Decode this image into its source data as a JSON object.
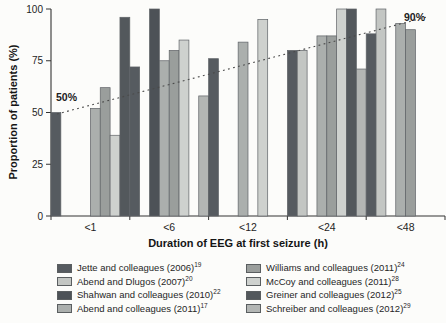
{
  "figure": {
    "background": "#fcfcfa",
    "axis_color": "#333333"
  },
  "chart_data": {
    "type": "bar",
    "title": "",
    "xlabel": "Duration of EEG at first seizure (h)",
    "ylabel": "Proportion of patients (%)",
    "ylim": [
      0,
      100
    ],
    "yticks": [
      0,
      25,
      50,
      75,
      100
    ],
    "categories": [
      "<1",
      "<6",
      "<12",
      "<24",
      "<48"
    ],
    "grid": false,
    "legend_position": "bottom",
    "slots_per_category": 8,
    "studies": [
      {
        "name": "Jette and colleagues (2006)",
        "ref": "19",
        "color": "#565b60"
      },
      {
        "name": "Abend and Dlugos (2007)",
        "ref": "20",
        "color": "#c3c6c3"
      },
      {
        "name": "Shahwan and colleagues (2010)",
        "ref": "22",
        "color": "#4d5257"
      },
      {
        "name": "Abend and colleagues (2011)",
        "ref": "17",
        "color": "#abafad"
      },
      {
        "name": "Williams and colleagues (2011)",
        "ref": "24",
        "color": "#9a9e9c"
      },
      {
        "name": "McCoy and colleagues (2011)",
        "ref": "28",
        "color": "#ced1ce"
      },
      {
        "name": "Greiner and colleagues (2012)",
        "ref": "25",
        "color": "#53585c"
      },
      {
        "name": "Schreiber and colleagues (2012)",
        "ref": "29",
        "color": "#b3b6b4"
      }
    ],
    "bars": [
      {
        "category": "<1",
        "study_index": 0,
        "slot": 0,
        "value": 50
      },
      {
        "category": "<1",
        "study_index": 3,
        "slot": 4,
        "value": 52
      },
      {
        "category": "<1",
        "study_index": 4,
        "slot": 5,
        "value": 62
      },
      {
        "category": "<1",
        "study_index": 5,
        "slot": 6,
        "value": 39
      },
      {
        "category": "<1",
        "study_index": 6,
        "slot": 7,
        "value": 96
      },
      {
        "category": "<6",
        "study_index": 0,
        "slot": 0,
        "value": 72
      },
      {
        "category": "<6",
        "study_index": 2,
        "slot": 2,
        "value": 100
      },
      {
        "category": "<6",
        "study_index": 3,
        "slot": 3,
        "value": 75
      },
      {
        "category": "<6",
        "study_index": 4,
        "slot": 4,
        "value": 80
      },
      {
        "category": "<6",
        "study_index": 5,
        "slot": 5,
        "value": 85
      },
      {
        "category": "<6",
        "study_index": 7,
        "slot": 7,
        "value": 58
      },
      {
        "category": "<12",
        "study_index": 0,
        "slot": 0,
        "value": 76
      },
      {
        "category": "<12",
        "study_index": 3,
        "slot": 3,
        "value": 84
      },
      {
        "category": "<12",
        "study_index": 5,
        "slot": 5,
        "value": 95
      },
      {
        "category": "<24",
        "study_index": 0,
        "slot": 0,
        "value": 80
      },
      {
        "category": "<24",
        "study_index": 1,
        "slot": 1,
        "value": 80
      },
      {
        "category": "<24",
        "study_index": 3,
        "slot": 3,
        "value": 87
      },
      {
        "category": "<24",
        "study_index": 4,
        "slot": 4,
        "value": 87
      },
      {
        "category": "<24",
        "study_index": 5,
        "slot": 5,
        "value": 100
      },
      {
        "category": "<24",
        "study_index": 6,
        "slot": 6,
        "value": 100
      },
      {
        "category": "<24",
        "study_index": 7,
        "slot": 7,
        "value": 71
      },
      {
        "category": "<48",
        "study_index": 0,
        "slot": 0,
        "value": 88
      },
      {
        "category": "<48",
        "study_index": 1,
        "slot": 1,
        "value": 100
      },
      {
        "category": "<48",
        "study_index": 3,
        "slot": 3,
        "value": 93
      },
      {
        "category": "<48",
        "study_index": 4,
        "slot": 4,
        "value": 90
      }
    ],
    "trend_line": {
      "style": "dotted",
      "start_value": 50,
      "end_value": 90,
      "label_start": "50%",
      "label_end": "90%"
    }
  }
}
